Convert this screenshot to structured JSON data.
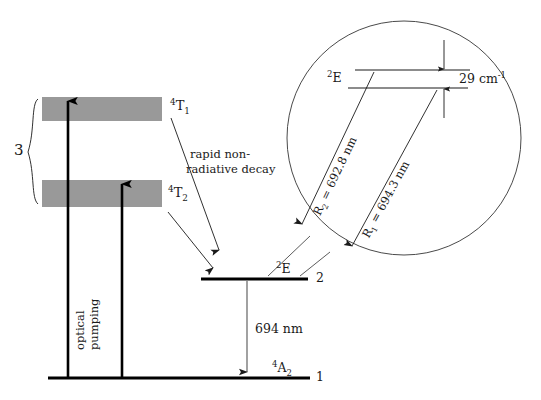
{
  "figure": {
    "colors": {
      "band_fill": "#999999",
      "line_dark": "#000000",
      "line_thin": "#555555",
      "circle_stroke": "#4a4a4a",
      "text": "#1a1a1a"
    }
  },
  "main_levels": {
    "band_upper": {
      "label_pre": "4",
      "label_main": "T",
      "label_sub": "1",
      "text": "4T1"
    },
    "band_lower": {
      "label_pre": "4",
      "label_main": "T",
      "label_sub": "2",
      "text": "4T2"
    },
    "level_2": {
      "label_pre": "2",
      "label_main": "E",
      "text": "2E",
      "number": "2"
    },
    "level_1": {
      "label_pre": "4",
      "label_main": "A",
      "label_sub": "2",
      "text": "4A2",
      "number": "1"
    },
    "brace_label": "3"
  },
  "annotations": {
    "pump_label_line1": "optical",
    "pump_label_line2": "pumping",
    "decay_line1": "rapid non-",
    "decay_line2": "radiative decay",
    "laser_transition": "694 nm"
  },
  "inset": {
    "doublet_label_pre": "2",
    "doublet_label_main": "E",
    "doublet_label": "2E",
    "splitting_value": "29",
    "splitting_unit": "cm",
    "splitting_exponent": "-1",
    "splitting_full": "29 cm-1",
    "transition_r2": {
      "name": "R",
      "index": "2",
      "equals": "=",
      "wavelength": "692.8 nm",
      "full": "R2 = 692.8 nm"
    },
    "transition_r1": {
      "name": "R",
      "index": "1",
      "equals": "=",
      "wavelength": "694.3 nm",
      "full": "R1 = 694.3 nm"
    }
  }
}
